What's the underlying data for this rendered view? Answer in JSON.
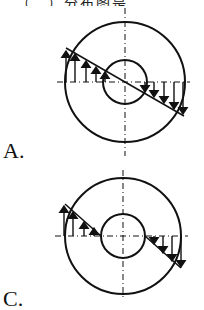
{
  "header": {
    "cut_text": "…（　）分布图是……"
  },
  "options": [
    {
      "label": "A.",
      "diagram": "stress-distribution-through-section",
      "center": [
        125,
        82
      ],
      "outer_radius": 60,
      "inner_radius": 22
    },
    {
      "label": "C.",
      "diagram": "stress-distribution-outside-inner-hole",
      "center": [
        123,
        236
      ],
      "outer_radius": 58,
      "inner_radius": 22
    }
  ],
  "colors": {
    "line": "#111111",
    "background": "#ffffff"
  }
}
